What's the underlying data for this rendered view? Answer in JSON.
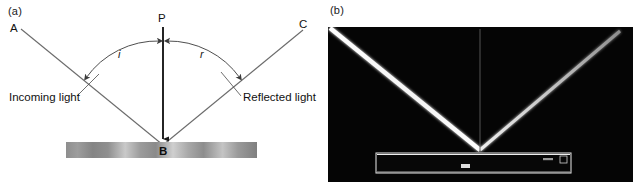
{
  "figure": {
    "panels": [
      {
        "id": "a",
        "label": "(a)",
        "kind": "ray-diagram",
        "points": [
          {
            "name": "A",
            "label": "A",
            "meaning": "source end of incoming ray"
          },
          {
            "name": "P",
            "label": "P",
            "meaning": "top of normal line"
          },
          {
            "name": "C",
            "label": "C",
            "meaning": "far end of reflected ray"
          },
          {
            "name": "B",
            "label": "B",
            "meaning": "point of incidence on mirror"
          }
        ],
        "angles": [
          {
            "symbol": "i",
            "meaning": "angle of incidence"
          },
          {
            "symbol": "r",
            "meaning": "angle of reflection"
          }
        ],
        "captions": {
          "incoming": "Incoming light",
          "reflected": "Reflected light"
        },
        "mirror": {
          "name": "mirror-surface"
        }
      },
      {
        "id": "b",
        "label": "(b)",
        "kind": "photograph",
        "description": "laser beam reflecting from a mirror"
      }
    ]
  },
  "colors": {
    "ray_line": "#6b6b6b",
    "normal_line": "#1a1a1a",
    "arc_line": "#3a3a3a",
    "text": "#111111",
    "photo_background": "#050505",
    "beam": "#ffffff",
    "mirror_outline": "#d8d8d8"
  }
}
